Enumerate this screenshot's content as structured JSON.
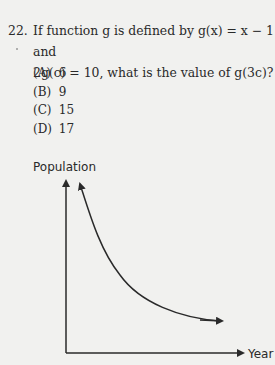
{
  "question": {
    "number": "22.",
    "text": "If function g is defined by g(x) = x − 1 and 2g(c) = 10, what is the value of g(3c)?",
    "line1": "If function g is defined by g(x) = x − 1 and",
    "line2": "2g(c) = 10, what is the value of g(3c)?"
  },
  "choices": [
    {
      "label": "(A)",
      "value": "6"
    },
    {
      "label": "(B)",
      "value": "9"
    },
    {
      "label": "(C)",
      "value": "15"
    },
    {
      "label": "(D)",
      "value": "17"
    }
  ],
  "graph": {
    "y_axis_label": "Population",
    "x_axis_label": "Year",
    "curve": "decreasing exponential decay curve approaching horizontal asymptote"
  }
}
